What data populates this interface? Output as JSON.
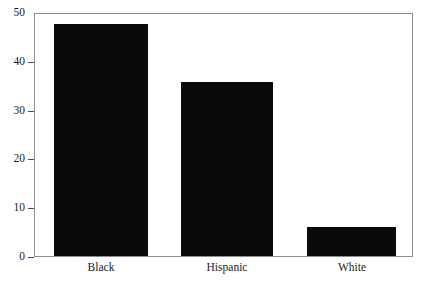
{
  "chart_data": {
    "type": "bar",
    "title": "",
    "subtitle": "",
    "xlabel": "",
    "ylabel": "",
    "categories": [
      "Black",
      "Hispanic",
      "White"
    ],
    "values": [
      48,
      36,
      6
    ],
    "series": [
      {
        "name": "",
        "values": [
          48,
          36,
          6
        ]
      }
    ],
    "ylim": [
      0,
      50
    ],
    "yticks": [
      0,
      10,
      20,
      30,
      40,
      50
    ],
    "ytick_labels": [
      "0",
      "10",
      "20",
      "30",
      "40",
      "50"
    ],
    "grid": false,
    "legend": false,
    "legend_position": "none",
    "bar_color": "#0a0a0a",
    "frame_color": "#8d8d8d",
    "background_color": "#ffffff",
    "annotations": []
  },
  "axis": {
    "y_tick_0": "0",
    "y_tick_1": "10",
    "y_tick_2": "20",
    "y_tick_3": "30",
    "y_tick_4": "40",
    "y_tick_5": "50",
    "x_cat_0": "Black",
    "x_cat_1": "Hispanic",
    "x_cat_2": "White"
  }
}
